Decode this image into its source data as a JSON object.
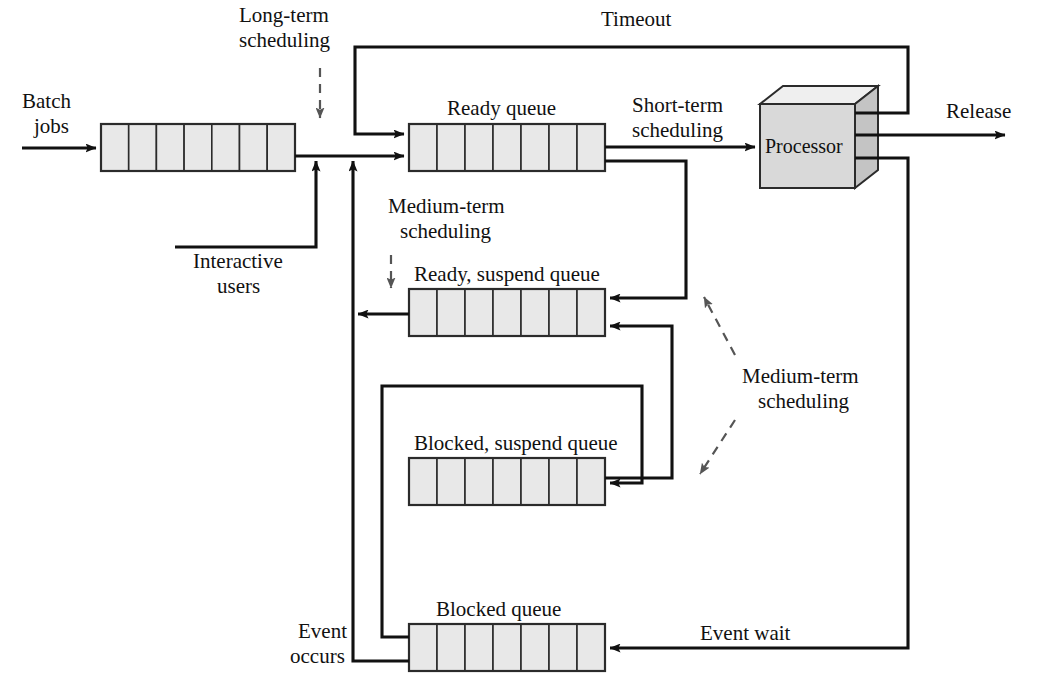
{
  "figure": {
    "type": "queueing-diagram",
    "background_color": "#ffffff",
    "line_color": "#111111",
    "queue_fill_color": "#e8e8e8",
    "dashed_line_color": "#555555"
  },
  "labels": {
    "batch_jobs": "Batch\njobs",
    "batch_jobs_line1": "Batch",
    "batch_jobs_line2": "jobs",
    "long_term_line1": "Long-term",
    "long_term_line2": "scheduling",
    "timeout": "Timeout",
    "ready_queue": "Ready queue",
    "short_term_line1": "Short-term",
    "short_term_line2": "scheduling",
    "processor": "Processor",
    "release": "Release",
    "interactive_line1": "Interactive",
    "interactive_line2": "users",
    "medium_term_left_line1": "Medium-term",
    "medium_term_left_line2": "scheduling",
    "ready_suspend_queue": "Ready, suspend queue",
    "medium_term_right_line1": "Medium-term",
    "medium_term_right_line2": "scheduling",
    "blocked_suspend_queue": "Blocked, suspend queue",
    "blocked_queue": "Blocked queue",
    "event_occurs_line1": "Event",
    "event_occurs_line2": "occurs",
    "event_wait": "Event wait"
  },
  "queues": [
    {
      "name": "batch-queue",
      "label": "",
      "cells": 7,
      "x": 101,
      "y": 124,
      "width": 194,
      "height": 47
    },
    {
      "name": "ready-queue",
      "label": "Ready queue",
      "cells": 7,
      "x": 409,
      "y": 124,
      "width": 196,
      "height": 47
    },
    {
      "name": "ready-suspend-queue",
      "label": "Ready, suspend queue",
      "cells": 7,
      "x": 409,
      "y": 289,
      "width": 196,
      "height": 47
    },
    {
      "name": "blocked-suspend-queue",
      "label": "Blocked, suspend queue",
      "cells": 7,
      "x": 409,
      "y": 458,
      "width": 196,
      "height": 47
    },
    {
      "name": "blocked-queue",
      "label": "Blocked queue",
      "cells": 7,
      "x": 409,
      "y": 624,
      "width": 196,
      "height": 47
    }
  ],
  "processor": {
    "name": "processor",
    "label": "Processor",
    "x": 760,
    "y": 104,
    "width": 95,
    "height": 84,
    "depth": 23
  },
  "flows": [
    {
      "name": "batch-jobs-arrow",
      "from": "Batch jobs",
      "to": "batch-queue"
    },
    {
      "name": "long-term-scheduling-arrow",
      "from": "Long-term scheduling",
      "to": "batch-queue",
      "style": "dashed"
    },
    {
      "name": "batch-to-ready-arrow",
      "from": "batch-queue",
      "to": "ready-queue"
    },
    {
      "name": "interactive-users-arrow",
      "from": "Interactive users",
      "to": "batch-to-ready line"
    },
    {
      "name": "timeout-arrow",
      "from": "processor",
      "to": "ready-queue"
    },
    {
      "name": "short-term-scheduling-arrow",
      "from": "ready-queue",
      "to": "processor"
    },
    {
      "name": "release-arrow",
      "from": "processor",
      "to": "Release"
    },
    {
      "name": "event-wait-arrow",
      "from": "processor",
      "to": "blocked-queue"
    },
    {
      "name": "ready-to-suspend-arrow",
      "from": "ready-queue",
      "to": "ready-suspend-queue"
    },
    {
      "name": "blocked-suspend-to-ready-suspend-arrow",
      "from": "blocked-suspend-queue",
      "to": "ready-suspend-queue"
    },
    {
      "name": "blocked-to-blocked-suspend-arrow",
      "from": "blocked-queue",
      "to": "blocked-suspend-queue"
    },
    {
      "name": "ready-suspend-to-ready-arrow",
      "from": "ready-suspend-queue",
      "to": "ready-queue"
    },
    {
      "name": "event-occurs-arrow",
      "from": "Event occurs",
      "to": "ready-queue"
    },
    {
      "name": "medium-term-scheduling-upper",
      "to": "ready-suspend-queue",
      "style": "dashed"
    },
    {
      "name": "medium-term-scheduling-lower",
      "to": "blocked-suspend-queue",
      "style": "dashed"
    },
    {
      "name": "medium-term-scheduling-left",
      "to": "ready-suspend-queue",
      "style": "dashed"
    }
  ]
}
